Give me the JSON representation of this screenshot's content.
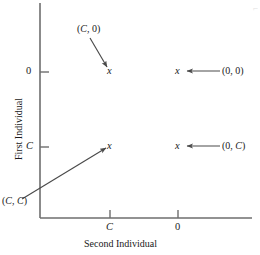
{
  "figure": {
    "axes": {
      "x_title": "Second Individual",
      "y_title": "First Individual",
      "x_ticks": [
        {
          "label": "C",
          "italic": true,
          "px": 110
        },
        {
          "label": "0",
          "italic": false,
          "px": 178
        }
      ],
      "y_ticks": [
        {
          "label": "0",
          "italic": false,
          "py": 72
        },
        {
          "label": "C",
          "italic": true,
          "py": 147
        }
      ],
      "x_axis_y": 218,
      "y_axis_x": 40,
      "x_axis_from": 40,
      "x_axis_to": 252,
      "y_axis_from": 3,
      "y_axis_to": 218
    },
    "markers": [
      {
        "name": "marker-c-0",
        "glyph": "x",
        "x": 110,
        "y": 72
      },
      {
        "name": "marker-0-0",
        "glyph": "x",
        "x": 178,
        "y": 72
      },
      {
        "name": "marker-c-c",
        "glyph": "x",
        "x": 110,
        "y": 147
      },
      {
        "name": "marker-0-c",
        "glyph": "x",
        "x": 178,
        "y": 147
      }
    ],
    "annotations": [
      {
        "name": "label-c-0",
        "text": "(C, 0)",
        "parts": [
          "(",
          "C",
          ", 0)"
        ],
        "x": 77,
        "y": 28,
        "arrow": {
          "x1": 90,
          "y1": 38,
          "x2": 107,
          "y2": 67
        }
      },
      {
        "name": "label-0-0",
        "text": "(0, 0)",
        "parts": [
          "(0, 0)"
        ],
        "x": 222,
        "y": 66,
        "arrow": {
          "x1": 220,
          "y1": 71,
          "x2": 186,
          "y2": 71
        }
      },
      {
        "name": "label-0-c",
        "text": "(0, C)",
        "parts": [
          "(0, ",
          "C",
          ")"
        ],
        "x": 222,
        "y": 141,
        "arrow": {
          "x1": 220,
          "y1": 146,
          "x2": 186,
          "y2": 146
        }
      },
      {
        "name": "label-c-c",
        "text": "(C, C)",
        "parts": [
          "(",
          "C",
          ", ",
          "C",
          ")"
        ],
        "x": 2,
        "y": 200,
        "arrow": {
          "x1": 22,
          "y1": 199,
          "x2": 106,
          "y2": 148
        }
      }
    ],
    "corner_mark": "⌐"
  },
  "chart_data": {
    "type": "scatter",
    "title": "",
    "xlabel": "Second Individual",
    "ylabel": "First Individual",
    "xticklabels": [
      "C",
      "0"
    ],
    "yticklabels": [
      "0",
      "C"
    ],
    "grid": false,
    "legend": "none",
    "points": [
      {
        "label": "(C, 0)",
        "x": "C",
        "y": "0"
      },
      {
        "label": "(0, 0)",
        "x": "0",
        "y": "0"
      },
      {
        "label": "(C, C)",
        "x": "C",
        "y": "C"
      },
      {
        "label": "(0, C)",
        "x": "0",
        "y": "C"
      }
    ],
    "note": "Four payoff points of a 2x2 game plotted on axes labelled First Individual (vertical) and Second Individual (horizontal); each point is marked with an x and annotated by an arrow."
  }
}
